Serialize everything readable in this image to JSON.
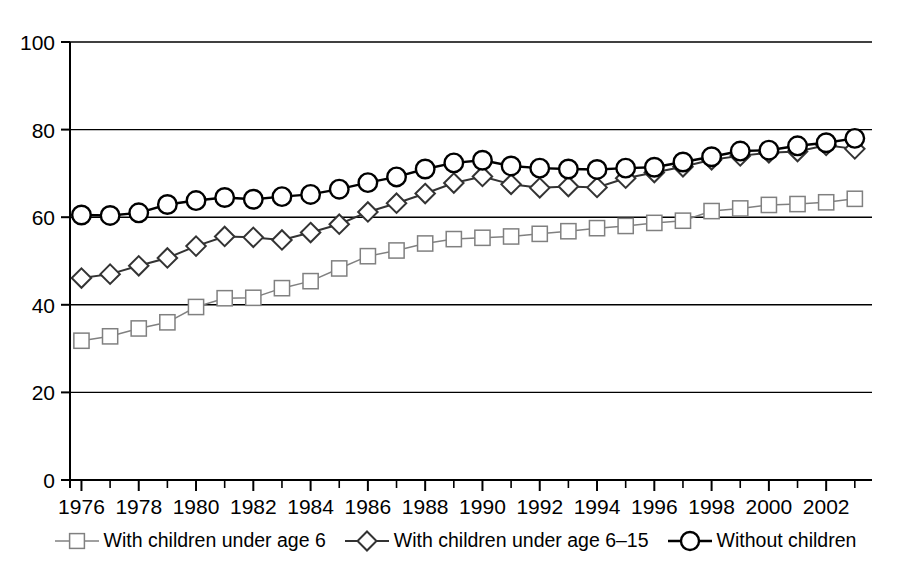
{
  "chart_data": {
    "type": "line",
    "title": "",
    "subtitle": "",
    "xlabel": "",
    "ylabel": "",
    "xlim": [
      1975.6,
      2003.6
    ],
    "ylim": [
      0,
      100
    ],
    "grid": true,
    "legend_position": "bottom",
    "x_tick_step": 2,
    "x_minor_tick_step": 1,
    "y_ticks": [
      0,
      20,
      40,
      60,
      80,
      100
    ],
    "x_tick_labels": [
      "1976",
      "1978",
      "1980",
      "1982",
      "1984",
      "1986",
      "1988",
      "1990",
      "1992",
      "1994",
      "1996",
      "1998",
      "2000",
      "2002"
    ],
    "y_tick_labels": [
      "0",
      "20",
      "40",
      "60",
      "80",
      "100"
    ],
    "x": [
      1976,
      1977,
      1978,
      1979,
      1980,
      1981,
      1982,
      1983,
      1984,
      1985,
      1986,
      1987,
      1988,
      1989,
      1990,
      1991,
      1992,
      1993,
      1994,
      1995,
      1996,
      1997,
      1998,
      1999,
      2000,
      2001,
      2002,
      2003
    ],
    "series": [
      {
        "name": "With children under age 6",
        "marker": "square",
        "color": "#808080",
        "values": [
          31.8,
          32.8,
          34.6,
          36.0,
          39.5,
          41.5,
          41.6,
          43.8,
          45.4,
          48.3,
          51.1,
          52.4,
          54.0,
          55.0,
          55.3,
          55.6,
          56.2,
          56.8,
          57.5,
          58.0,
          58.7,
          59.2,
          61.4,
          62.0,
          62.8,
          63.0,
          63.4,
          64.2
        ]
      },
      {
        "name": "With children under age 6–15",
        "marker": "diamond",
        "color": "#333333",
        "values": [
          46.1,
          47.0,
          48.9,
          50.7,
          53.4,
          55.6,
          55.4,
          54.8,
          56.5,
          58.4,
          61.2,
          63.2,
          65.4,
          67.8,
          69.3,
          67.5,
          66.7,
          67.0,
          66.8,
          68.9,
          70.2,
          71.5,
          73.1,
          74.0,
          74.7,
          75.0,
          76.4,
          75.6
        ]
      },
      {
        "name": "Without children",
        "marker": "circle",
        "color": "#000000",
        "values": [
          60.5,
          60.4,
          61.0,
          62.9,
          63.8,
          64.5,
          64.1,
          64.7,
          65.2,
          66.4,
          67.9,
          69.2,
          71.0,
          72.4,
          73.0,
          71.7,
          71.2,
          71.0,
          70.9,
          71.2,
          71.4,
          72.6,
          73.8,
          75.1,
          75.3,
          76.3,
          77.0,
          78.0
        ]
      }
    ]
  },
  "legend": {
    "items": [
      {
        "label": "With children under age 6",
        "marker": "square"
      },
      {
        "label": "With children under age 6–15",
        "marker": "diamond"
      },
      {
        "label": "Without children",
        "marker": "circle"
      }
    ]
  }
}
